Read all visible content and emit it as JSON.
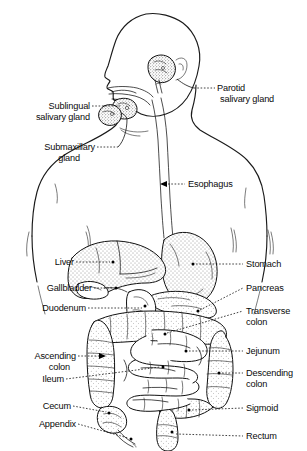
{
  "figure": {
    "orientation": "left-facing profile, head and torso",
    "style": "black-and-white line drawing with stippled shading",
    "background_color": "#ffffff",
    "line_color": "#111111",
    "text_color": "#0a0a0a"
  },
  "labels": {
    "parotid": {
      "line1": "Parotid",
      "line2": "salivary gland"
    },
    "sublingual": {
      "line1": "Sublingual",
      "line2": "salivary gland"
    },
    "submaxillary": {
      "line1": "Submaxillary",
      "line2": "gland"
    },
    "esophagus": {
      "line1": "Esophagus"
    },
    "liver": {
      "line1": "Liver"
    },
    "gallbladder": {
      "line1": "Gallbladder"
    },
    "duodenum": {
      "line1": "Duodenum"
    },
    "stomach": {
      "line1": "Stomach"
    },
    "pancreas": {
      "line1": "Pancreas"
    },
    "transverse_colon": {
      "line1": "Transverse",
      "line2": "colon"
    },
    "jejunum": {
      "line1": "Jejunum"
    },
    "ascending_colon": {
      "line1": "Ascending",
      "line2": "colon"
    },
    "ileum": {
      "line1": "Ileum"
    },
    "descending_colon": {
      "line1": "Descending",
      "line2": "colon"
    },
    "cecum": {
      "line1": "Cecum"
    },
    "sigmoid": {
      "line1": "Sigmoid"
    },
    "appendix": {
      "line1": "Appendix"
    },
    "rectum": {
      "line1": "Rectum"
    }
  }
}
